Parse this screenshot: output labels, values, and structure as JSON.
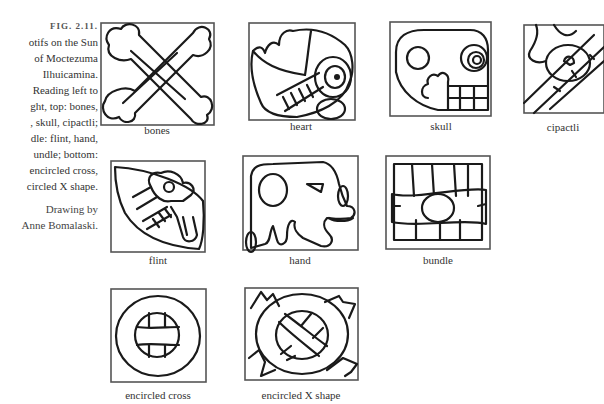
{
  "figure": {
    "number": "FIG. 2.11.",
    "caption_lines": [
      "otifs on the Sun",
      "of Moctezuma",
      "Ilhuicamina.",
      "Reading left to",
      "ght, top: bones,",
      ", skull, cipactli;",
      "dle: flint, hand,",
      "undle; bottom:",
      "encircled cross,",
      "circled X shape."
    ],
    "credit_lines": [
      "Drawing by",
      "Anne Bomalaski."
    ]
  },
  "motifs": {
    "bones": {
      "label": "bones"
    },
    "heart": {
      "label": "heart"
    },
    "skull": {
      "label": "skull"
    },
    "cipactli": {
      "label": "cipactli"
    },
    "flint": {
      "label": "flint"
    },
    "hand": {
      "label": "hand"
    },
    "bundle": {
      "label": "bundle"
    },
    "encircled_cross": {
      "label": "encircled cross"
    },
    "encircled_x": {
      "label": "encircled X shape"
    }
  }
}
